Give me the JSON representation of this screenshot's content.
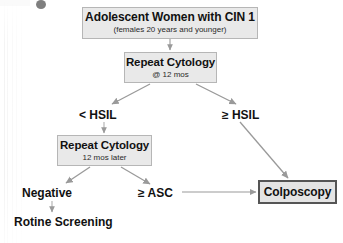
{
  "figure": {
    "kind": "clinical-management-flowchart",
    "topic": "Management of adolescent women with CIN 1",
    "accent_box_fill": "#e9e9e9",
    "accent_box_border": "#b6b6b6",
    "outcome_box_border": "#555555",
    "arrow_color": "#9a9a9a",
    "text_color": "#111111"
  },
  "nodes": {
    "start": {
      "title": "Adolescent Women with CIN 1",
      "subtitle": "(females 20 years and younger)"
    },
    "repeat_cytology_1": {
      "title": "Repeat Cytology",
      "subtitle": "@ 12 mos"
    },
    "repeat_cytology_2": {
      "title": "Repeat Cytology",
      "subtitle": "12 mos later"
    },
    "colposcopy": {
      "title": "Colposcopy"
    }
  },
  "labels": {
    "less_than_hsil": "< HSIL",
    "greater_equal_hsil": "≥ HSIL",
    "negative": "Negative",
    "greater_equal_asc": "≥ ASC",
    "routine_screening": "Rotine Screening"
  },
  "edges": [
    {
      "name": "start-to-repeat-cytology-1",
      "from": "start",
      "to": "repeat_cytology_1",
      "style": "straight-down"
    },
    {
      "name": "repeat-cytology-1-to-less-than-hsil",
      "from": "repeat_cytology_1",
      "to": "less_than_hsil",
      "style": "diagonal-down-left"
    },
    {
      "name": "repeat-cytology-1-to-greater-equal-hsil",
      "from": "repeat_cytology_1",
      "to": "greater_equal_hsil",
      "style": "diagonal-down-right"
    },
    {
      "name": "less-than-hsil-to-repeat-cytology-2",
      "from": "less_than_hsil",
      "to": "repeat_cytology_2",
      "style": "straight-down"
    },
    {
      "name": "repeat-cytology-2-to-negative",
      "from": "repeat_cytology_2",
      "to": "negative",
      "style": "diagonal-down-left"
    },
    {
      "name": "repeat-cytology-2-to-greater-equal-asc",
      "from": "repeat_cytology_2",
      "to": "greater_equal_asc",
      "style": "diagonal-down-right"
    },
    {
      "name": "negative-to-routine-screening",
      "from": "negative",
      "to": "routine_screening",
      "style": "straight-down"
    },
    {
      "name": "greater-equal-asc-to-colposcopy",
      "from": "greater_equal_asc",
      "to": "colposcopy",
      "style": "straight-right"
    },
    {
      "name": "greater-equal-hsil-to-colposcopy",
      "from": "greater_equal_hsil",
      "to": "colposcopy",
      "style": "long-diagonal-down-right"
    }
  ]
}
